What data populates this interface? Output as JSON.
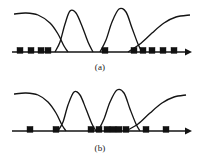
{
  "figure": {
    "background_color": "#ffffff",
    "ink_color": "#141414",
    "marker_color": "#111111",
    "panels": [
      {
        "id": "a",
        "caption": "(a)",
        "axis": {
          "x_start": 12,
          "x_end": 192,
          "y": 52,
          "arrow": "right",
          "arrow_size": 7
        },
        "curves": [
          {
            "name": "curve-1",
            "role": "left-plateau-descending",
            "peak_x": 14,
            "peak_y": 14,
            "points": [
              [
                14,
                14
              ],
              [
                26,
                13
              ],
              [
                38,
                15
              ],
              [
                50,
                23
              ],
              [
                58,
                34
              ],
              [
                64,
                46
              ],
              [
                68,
                52
              ]
            ]
          },
          {
            "name": "curve-2",
            "role": "bell",
            "peak_x": 70,
            "peak_y": 11,
            "points": [
              [
                55,
                52
              ],
              [
                60,
                42
              ],
              [
                65,
                24
              ],
              [
                70,
                11
              ],
              [
                76,
                13
              ],
              [
                82,
                26
              ],
              [
                88,
                42
              ],
              [
                93,
                52
              ]
            ]
          },
          {
            "name": "curve-3",
            "role": "bell",
            "peak_x": 120,
            "peak_y": 9,
            "points": [
              [
                100,
                52
              ],
              [
                106,
                40
              ],
              [
                112,
                22
              ],
              [
                119,
                9
              ],
              [
                126,
                12
              ],
              [
                132,
                28
              ],
              [
                138,
                44
              ],
              [
                142,
                52
              ]
            ]
          },
          {
            "name": "curve-4",
            "role": "right-rising-plateau",
            "peak_x": 190,
            "peak_y": 15,
            "points": [
              [
                128,
                52
              ],
              [
                140,
                44
              ],
              [
                152,
                33
              ],
              [
                164,
                23
              ],
              [
                176,
                17
              ],
              [
                190,
                15
              ]
            ]
          }
        ],
        "markers": {
          "shape": "square",
          "size": 6,
          "count": 10,
          "x_positions": [
            20,
            31,
            41,
            48,
            105,
            134,
            143,
            152,
            163,
            174
          ]
        }
      },
      {
        "id": "b",
        "caption": "(b)",
        "axis": {
          "x_start": 12,
          "x_end": 192,
          "y": 50,
          "arrow": "right",
          "arrow_size": 7
        },
        "curves": [
          {
            "name": "curve-1",
            "role": "left-plateau-descending",
            "peak_x": 14,
            "peak_y": 13,
            "points": [
              [
                14,
                13
              ],
              [
                26,
                12
              ],
              [
                38,
                14
              ],
              [
                48,
                21
              ],
              [
                56,
                32
              ],
              [
                62,
                44
              ],
              [
                66,
                50
              ]
            ]
          },
          {
            "name": "curve-2",
            "role": "bell",
            "peak_x": 74,
            "peak_y": 11,
            "points": [
              [
                58,
                50
              ],
              [
                63,
                41
              ],
              [
                68,
                24
              ],
              [
                74,
                11
              ],
              [
                80,
                14
              ],
              [
                86,
                28
              ],
              [
                92,
                43
              ],
              [
                96,
                50
              ]
            ]
          },
          {
            "name": "curve-3",
            "role": "bell",
            "peak_x": 118,
            "peak_y": 9,
            "points": [
              [
                98,
                50
              ],
              [
                104,
                38
              ],
              [
                110,
                21
              ],
              [
                117,
                9
              ],
              [
                124,
                12
              ],
              [
                130,
                28
              ],
              [
                136,
                43
              ],
              [
                140,
                50
              ]
            ]
          },
          {
            "name": "curve-4",
            "role": "right-rising-plateau",
            "peak_x": 186,
            "peak_y": 14,
            "points": [
              [
                126,
                50
              ],
              [
                138,
                43
              ],
              [
                150,
                32
              ],
              [
                162,
                22
              ],
              [
                174,
                16
              ],
              [
                186,
                14
              ]
            ]
          }
        ],
        "markers": {
          "shape": "square",
          "size": 6,
          "count": 10,
          "x_positions": [
            30,
            56,
            91,
            99,
            107,
            113,
            119,
            126,
            146,
            166
          ]
        }
      }
    ]
  }
}
